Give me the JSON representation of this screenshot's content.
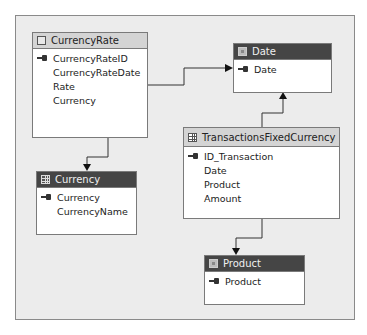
{
  "tables": {
    "currency_rate": {
      "title": "CurrencyRate",
      "icon": "view-icon",
      "columns": [
        {
          "name": "CurrencyRateID",
          "key": true
        },
        {
          "name": "CurrencyRateDate",
          "key": false
        },
        {
          "name": "Rate",
          "key": false
        },
        {
          "name": "Currency",
          "key": false
        }
      ]
    },
    "date": {
      "title": "Date",
      "icon": "dimension-icon",
      "columns": [
        {
          "name": "Date",
          "key": true
        }
      ]
    },
    "currency": {
      "title": "Currency",
      "icon": "table-icon",
      "columns": [
        {
          "name": "Currency",
          "key": true
        },
        {
          "name": "CurrencyName",
          "key": false
        }
      ]
    },
    "transactions": {
      "title": "TransactionsFixedCurrency",
      "icon": "table-icon",
      "columns": [
        {
          "name": "ID_Transaction",
          "key": true
        },
        {
          "name": "Date",
          "key": false
        },
        {
          "name": "Product",
          "key": false
        },
        {
          "name": "Amount",
          "key": false
        }
      ]
    },
    "product": {
      "title": "Product",
      "icon": "dimension-icon",
      "columns": [
        {
          "name": "Product",
          "key": true
        }
      ]
    }
  },
  "relationships": [
    {
      "from": "CurrencyRate",
      "to": "Date"
    },
    {
      "from": "CurrencyRate",
      "to": "Currency"
    },
    {
      "from": "TransactionsFixedCurrency",
      "to": "Date"
    },
    {
      "from": "TransactionsFixedCurrency",
      "to": "Product"
    }
  ],
  "colors": {
    "dark_header": "#454545",
    "light_header": "#d4d4d4",
    "canvas": "#ececec"
  }
}
